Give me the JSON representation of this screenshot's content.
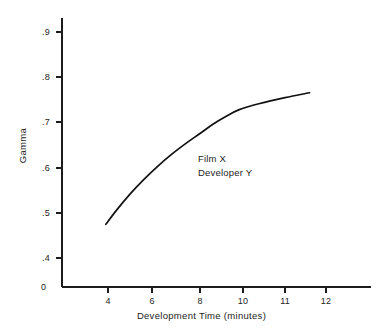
{
  "figure": {
    "background_color": "#ffffff",
    "line_color": "#111111",
    "text_color": "#232323"
  },
  "chart_data": {
    "type": "line",
    "title": "",
    "subtitle": "",
    "xlabel": "Development Time (minutes)",
    "ylabel": "Gamma",
    "xlim": [
      0,
      12.8
    ],
    "ylim": [
      0.355,
      0.94
    ],
    "grid": false,
    "legend": "none",
    "origin_label": "0",
    "xticks": [
      4,
      6,
      8,
      10,
      11,
      12
    ],
    "xtick_labels": [
      "4",
      "6",
      "8",
      "10",
      "11",
      "12"
    ],
    "yticks": [
      0.4,
      0.5,
      0.6,
      0.7,
      0.8,
      0.9
    ],
    "ytick_labels": [
      ".4",
      ".5",
      ".6",
      ".7",
      ".8",
      ".9"
    ],
    "series": [
      {
        "name": "Film X / Developer Y",
        "x": [
          3.9,
          4.4,
          5.0,
          5.6,
          6.2,
          6.8,
          7.4,
          8.0,
          8.6,
          9.2,
          9.8,
          10.4,
          11.0,
          11.6
        ],
        "y": [
          0.475,
          0.507,
          0.542,
          0.573,
          0.602,
          0.629,
          0.653,
          0.675,
          0.695,
          0.712,
          0.727,
          0.741,
          0.754,
          0.765
        ]
      }
    ],
    "annotations": [
      {
        "text": "Film X",
        "x": 8.0,
        "y": 0.627
      },
      {
        "text": "Developer Y",
        "x": 8.0,
        "y": 0.596
      }
    ]
  },
  "annotation_block": {
    "line1": "Film X",
    "line2": "Developer Y"
  }
}
